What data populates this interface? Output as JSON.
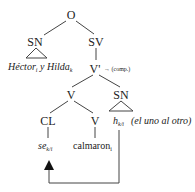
{
  "diagram": {
    "type": "syntax-tree",
    "nodes": {
      "root": "O",
      "subject_np": "SN",
      "vp": "SV",
      "v_bar": "V'",
      "v_bar_note": "→ (comp.)",
      "v_head": "V",
      "object_np": "SN",
      "clitic": "CL",
      "verb": "V"
    },
    "leaves": {
      "subject_text_a": "Héctor",
      "subject_sub_a": "i",
      "subject_conj": " y ",
      "subject_text_b": "Hilda",
      "subject_sub_b": "k",
      "trace": "h",
      "trace_sub": "k/i",
      "trace_gloss": "(el uno al otro)",
      "clitic_text": "se",
      "clitic_sub": "k/i",
      "verb_text": "calmaron",
      "verb_sub": "i"
    },
    "arrow": {
      "from": "trace",
      "to": "clitic",
      "description": "movement arrow from trace to clitic"
    }
  }
}
